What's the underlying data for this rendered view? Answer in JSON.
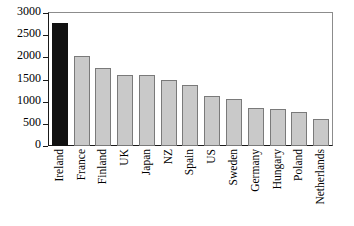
{
  "chart_data": {
    "type": "bar",
    "title": "",
    "subtitle": "",
    "xlabel": "",
    "ylabel": "",
    "categories": [
      "Ireland",
      "France",
      "Finland",
      "UK",
      "Japan",
      "NZ",
      "Spain",
      "US",
      "Sweden",
      "Germany",
      "Hungary",
      "Poland",
      "Netherlands"
    ],
    "values": [
      2780,
      2040,
      1760,
      1610,
      1610,
      1500,
      1370,
      1120,
      1060,
      860,
      830,
      770,
      620
    ],
    "ylim": [
      0,
      3000
    ],
    "yticks": [
      0,
      500,
      1000,
      1500,
      2000,
      2500,
      3000
    ],
    "ytick_labels": [
      "0",
      "500",
      "1000",
      "1500",
      "2000",
      "2500",
      "3000"
    ],
    "grid": false,
    "legend": "none",
    "bar_color": "#c9c9c9",
    "bar_edge_color": "#7a7a7a",
    "highlight_index": 0,
    "highlight_color": "#111111",
    "axis_color": "#1a1a1a",
    "frame_color": "#8c8c8c",
    "background": "#ffffff"
  }
}
